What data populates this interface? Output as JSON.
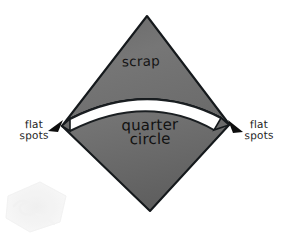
{
  "figure": {
    "background_color": "#ffffff",
    "width": 289,
    "height": 240
  },
  "shapes": {
    "diamond": {
      "name": "square rotated 45 degrees",
      "fill_color": "#6f6f6f",
      "outline_color": "#1a1a1a",
      "vertices": {
        "top": [
          147,
          16
        ],
        "left": [
          62,
          126
        ],
        "right": [
          229,
          125
        ],
        "bottom": [
          150,
          211
        ]
      }
    },
    "scrap_piece": {
      "label": "scrap",
      "fill_color": "#707070",
      "description": "upper triangular offcut above the arc"
    },
    "quarter_circle_piece": {
      "label": "quarter circle",
      "fill_color": "#6d6d6d",
      "description": "lower piece bounded above by the circular arc"
    },
    "cut_gap": {
      "name": "saw kerf",
      "fill_color": "#ffffff",
      "description": "white curved band separating scrap from quarter circle"
    }
  },
  "labels": {
    "scrap": "scrap",
    "quarter_circle_line1": "quarter",
    "quarter_circle_line2": "circle",
    "flat_spots_left_line1": "flat",
    "flat_spots_left_line2": "spots",
    "flat_spots_right_line1": "flat",
    "flat_spots_right_line2": "spots"
  },
  "annotations": {
    "arrow_left": {
      "name": "left flat spot arrow",
      "color": "#101010",
      "points_to": [
        65,
        123
      ]
    },
    "arrow_right": {
      "name": "right flat spot arrow",
      "color": "#101010",
      "points_to": [
        226,
        123
      ]
    }
  },
  "watermark": {
    "name": "corner watermark",
    "color": "#f0f0f0",
    "position": "bottom-left"
  }
}
